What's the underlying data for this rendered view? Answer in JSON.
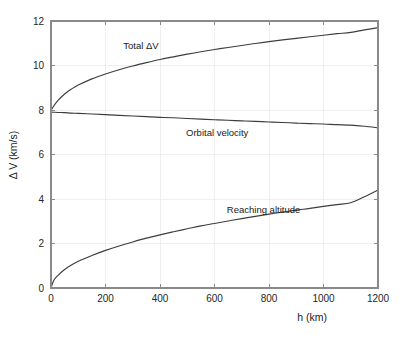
{
  "chart_data": {
    "type": "line",
    "title": "",
    "subtitle": "",
    "xlabel": "h (km)",
    "ylabel": "Δ V (km/s)",
    "xlim": [
      0,
      1200
    ],
    "ylim": [
      0,
      12
    ],
    "xticks": [
      0,
      200,
      400,
      600,
      800,
      1000,
      1200
    ],
    "yticks": [
      0,
      2,
      4,
      6,
      8,
      10,
      12
    ],
    "xtick_labels": [
      "0",
      "200",
      "400",
      "600",
      "800",
      "1000",
      "1200"
    ],
    "ytick_labels": [
      "0",
      "2",
      "4",
      "6",
      "8",
      "10",
      "12"
    ],
    "grid": true,
    "grid_color": "#e8e8e8",
    "legend_position": "inline-annotations",
    "line_color": "#3d3d3d",
    "axis_color": "#8a8a8a",
    "background": "#ffffff",
    "x": [
      0,
      10,
      25,
      50,
      75,
      100,
      150,
      200,
      250,
      300,
      350,
      400,
      450,
      500,
      550,
      600,
      650,
      700,
      750,
      800,
      850,
      900,
      950,
      1000,
      1050,
      1100,
      1150,
      1200
    ],
    "series": [
      {
        "name": "Total ΔV",
        "label": "Total ΔV",
        "label_x": 330,
        "label_y": 10.75,
        "values": [
          7.98,
          8.18,
          8.42,
          8.72,
          8.94,
          9.12,
          9.4,
          9.62,
          9.81,
          9.98,
          10.13,
          10.27,
          10.39,
          10.51,
          10.62,
          10.72,
          10.81,
          10.9,
          10.99,
          11.07,
          11.15,
          11.22,
          11.29,
          11.36,
          11.43,
          11.49,
          11.6,
          11.7
        ]
      },
      {
        "name": "Orbital velocity",
        "label": "Orbital velocity",
        "label_x": 610,
        "label_y": 6.85,
        "values": [
          7.905,
          7.9,
          7.89,
          7.88,
          7.86,
          7.85,
          7.82,
          7.79,
          7.76,
          7.73,
          7.7,
          7.67,
          7.65,
          7.62,
          7.59,
          7.56,
          7.54,
          7.51,
          7.49,
          7.46,
          7.44,
          7.41,
          7.39,
          7.37,
          7.34,
          7.32,
          7.27,
          7.2
        ]
      },
      {
        "name": "Reaching altitude",
        "label": "Reaching altitude",
        "label_x": 780,
        "label_y": 3.35,
        "values": [
          0.0,
          0.34,
          0.56,
          0.83,
          1.03,
          1.2,
          1.46,
          1.69,
          1.89,
          2.07,
          2.24,
          2.39,
          2.53,
          2.66,
          2.79,
          2.9,
          3.01,
          3.12,
          3.22,
          3.32,
          3.41,
          3.5,
          3.58,
          3.67,
          3.75,
          3.83,
          4.1,
          4.4
        ]
      }
    ]
  },
  "figure": {
    "name": "delta-v-vs-altitude-plot"
  }
}
